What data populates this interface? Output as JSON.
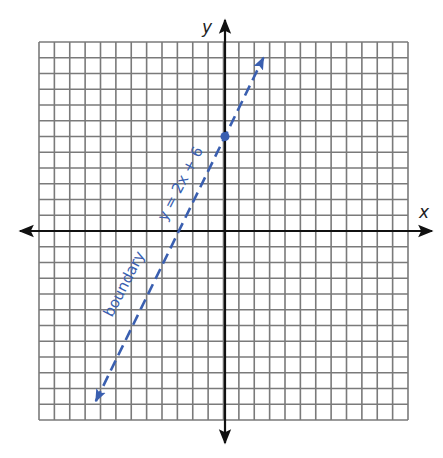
{
  "chart_data": {
    "type": "line",
    "title": "",
    "xlabel": "x",
    "ylabel": "y",
    "grid": true,
    "xlim": [
      -12,
      12
    ],
    "ylim": [
      -12,
      12
    ],
    "series": [
      {
        "name": "boundary y = 2x + 6",
        "equation": "y = 2x + 6",
        "slope": 2,
        "intercept": 6,
        "style": "dashed",
        "arrows": "both",
        "x": [
          -8.4,
          2.5
        ],
        "y": [
          -10.8,
          11
        ]
      }
    ],
    "points": [
      {
        "x": 0,
        "y": 6,
        "label": "y-intercept"
      }
    ],
    "annotations": [
      "boundary",
      "y = 2x + 6"
    ]
  },
  "labels": {
    "x_axis": "x",
    "y_axis": "y",
    "boundary": "boundary",
    "equation": "y = 2x + 6"
  },
  "colors": {
    "line": "#3a5fb0",
    "grid": "#7a7a7a",
    "axis": "#111111"
  },
  "layout": {
    "grid_left": 39,
    "grid_top": 42,
    "cols": 24,
    "rows": 24,
    "cell_w": 15.375,
    "cell_h": 15.75
  }
}
